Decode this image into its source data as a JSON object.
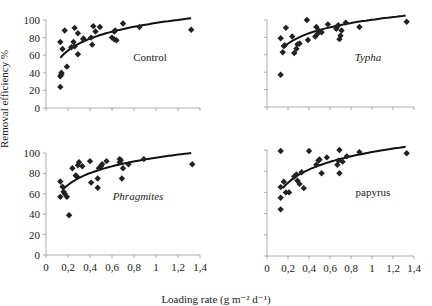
{
  "figure": {
    "ylabel": "Removal efficiency %",
    "xlabel": "Loading rate (g m⁻² d⁻¹)",
    "marker_color": "#222222",
    "line_color": "#111111",
    "axis_color": "#999999"
  },
  "chart_data": [
    {
      "type": "scatter",
      "title": "Control",
      "title_style": "normal",
      "xlabel": "",
      "ylabel": "Removal efficiency %",
      "xlim": [
        0,
        1.4
      ],
      "ylim": [
        0,
        100
      ],
      "xticks": [
        "0",
        "0,2",
        "0,4",
        "0,6",
        "0,8",
        "1",
        "1,2",
        "1,4"
      ],
      "yticks": [
        "0",
        "20",
        "40",
        "60",
        "80",
        "100"
      ],
      "show_x_tick_labels": false,
      "show_y_tick_labels": true,
      "points": [
        [
          0.13,
          24
        ],
        [
          0.13,
          36
        ],
        [
          0.14,
          38
        ],
        [
          0.14,
          40
        ],
        [
          0.13,
          75
        ],
        [
          0.15,
          67
        ],
        [
          0.17,
          88
        ],
        [
          0.19,
          47
        ],
        [
          0.23,
          69
        ],
        [
          0.25,
          75
        ],
        [
          0.26,
          91
        ],
        [
          0.26,
          70
        ],
        [
          0.29,
          85
        ],
        [
          0.29,
          61
        ],
        [
          0.34,
          78
        ],
        [
          0.34,
          79
        ],
        [
          0.41,
          80
        ],
        [
          0.42,
          72
        ],
        [
          0.43,
          93
        ],
        [
          0.45,
          87
        ],
        [
          0.49,
          92
        ],
        [
          0.6,
          80
        ],
        [
          0.62,
          78
        ],
        [
          0.62,
          87
        ],
        [
          0.63,
          88
        ],
        [
          0.64,
          77
        ],
        [
          0.7,
          96
        ],
        [
          0.85,
          92
        ],
        [
          1.32,
          89
        ]
      ],
      "trend": {
        "type": "log",
        "x_from": 0.13,
        "x_to": 1.32,
        "y_from": 57,
        "y_to": 102
      }
    },
    {
      "type": "scatter",
      "title": "Typha",
      "title_style": "italic",
      "xlim": [
        0,
        1.4
      ],
      "ylim": [
        0,
        100
      ],
      "xticks": [
        "0",
        "0,2",
        "0,4",
        "0,6",
        "0,8",
        "1",
        "1,2",
        "1,4"
      ],
      "yticks": [
        "0",
        "20",
        "40",
        "60",
        "80",
        "100"
      ],
      "show_x_tick_labels": false,
      "show_y_tick_labels": false,
      "points": [
        [
          0.13,
          37
        ],
        [
          0.13,
          79
        ],
        [
          0.15,
          63
        ],
        [
          0.16,
          70
        ],
        [
          0.17,
          71
        ],
        [
          0.18,
          91
        ],
        [
          0.24,
          81
        ],
        [
          0.26,
          62
        ],
        [
          0.28,
          67
        ],
        [
          0.29,
          72
        ],
        [
          0.31,
          73
        ],
        [
          0.38,
          100
        ],
        [
          0.39,
          77
        ],
        [
          0.46,
          81
        ],
        [
          0.47,
          92
        ],
        [
          0.48,
          84
        ],
        [
          0.49,
          88
        ],
        [
          0.52,
          86
        ],
        [
          0.58,
          95
        ],
        [
          0.66,
          90
        ],
        [
          0.67,
          93
        ],
        [
          0.68,
          94
        ],
        [
          0.69,
          78
        ],
        [
          0.7,
          82
        ],
        [
          0.71,
          88
        ],
        [
          0.75,
          97
        ],
        [
          0.88,
          92
        ],
        [
          1.33,
          98
        ]
      ],
      "trend": {
        "type": "log",
        "x_from": 0.15,
        "x_to": 1.32,
        "y_from": 68,
        "y_to": 105
      }
    },
    {
      "type": "scatter",
      "title": "Phragmites",
      "title_style": "italic",
      "xlim": [
        0,
        1.4
      ],
      "ylim": [
        0,
        100
      ],
      "xticks": [
        "0",
        "0,2",
        "0,4",
        "0,6",
        "0,8",
        "1",
        "1,2",
        "1,4"
      ],
      "yticks": [
        "0",
        "20",
        "40",
        "60",
        "80",
        "100"
      ],
      "show_x_tick_labels": true,
      "show_y_tick_labels": true,
      "points": [
        [
          0.13,
          57
        ],
        [
          0.13,
          72
        ],
        [
          0.15,
          67
        ],
        [
          0.16,
          62
        ],
        [
          0.17,
          60
        ],
        [
          0.19,
          57
        ],
        [
          0.21,
          39
        ],
        [
          0.24,
          85
        ],
        [
          0.27,
          78
        ],
        [
          0.28,
          77
        ],
        [
          0.29,
          88
        ],
        [
          0.3,
          91
        ],
        [
          0.33,
          87
        ],
        [
          0.4,
          92
        ],
        [
          0.41,
          71
        ],
        [
          0.47,
          66
        ],
        [
          0.47,
          75
        ],
        [
          0.48,
          85
        ],
        [
          0.5,
          87
        ],
        [
          0.51,
          89
        ],
        [
          0.55,
          92
        ],
        [
          0.67,
          91
        ],
        [
          0.67,
          94
        ],
        [
          0.68,
          93
        ],
        [
          0.69,
          75
        ],
        [
          0.7,
          85
        ],
        [
          0.75,
          89
        ],
        [
          0.89,
          94
        ],
        [
          1.33,
          89
        ]
      ],
      "trend": {
        "type": "log",
        "x_from": 0.15,
        "x_to": 1.32,
        "y_from": 64,
        "y_to": 100
      }
    },
    {
      "type": "scatter",
      "title": "papyrus",
      "title_style": "normal",
      "xlim": [
        0,
        1.4
      ],
      "ylim": [
        0,
        100
      ],
      "xticks": [
        "0",
        "0,2",
        "0,4",
        "0,6",
        "0,8",
        "1",
        "1,2",
        "1,4"
      ],
      "yticks": [
        "0",
        "20",
        "40",
        "60",
        "80",
        "100"
      ],
      "show_x_tick_labels": true,
      "show_y_tick_labels": false,
      "points": [
        [
          0.13,
          44
        ],
        [
          0.13,
          55
        ],
        [
          0.13,
          65
        ],
        [
          0.13,
          99
        ],
        [
          0.16,
          70
        ],
        [
          0.18,
          60
        ],
        [
          0.21,
          60
        ],
        [
          0.26,
          75
        ],
        [
          0.28,
          77
        ],
        [
          0.29,
          71
        ],
        [
          0.31,
          68
        ],
        [
          0.33,
          79
        ],
        [
          0.35,
          64
        ],
        [
          0.4,
          99
        ],
        [
          0.47,
          86
        ],
        [
          0.49,
          90
        ],
        [
          0.5,
          91
        ],
        [
          0.52,
          78
        ],
        [
          0.57,
          93
        ],
        [
          0.67,
          86
        ],
        [
          0.68,
          90
        ],
        [
          0.69,
          100
        ],
        [
          0.69,
          78
        ],
        [
          0.72,
          89
        ],
        [
          0.76,
          94
        ],
        [
          0.88,
          98
        ],
        [
          1.33,
          97
        ]
      ],
      "trend": {
        "type": "log",
        "x_from": 0.15,
        "x_to": 1.32,
        "y_from": 64,
        "y_to": 103
      }
    }
  ],
  "layout": {
    "panels": [
      {
        "x0": 46,
        "x1": 200,
        "y0": 108,
        "y1": 20,
        "label_x": 150,
        "label_y": 61
      },
      {
        "x0": 267,
        "x1": 414,
        "y0": 107,
        "y1": 20,
        "label_x": 368,
        "label_y": 61
      },
      {
        "x0": 46,
        "x1": 200,
        "y0": 255,
        "y1": 153,
        "label_x": 138,
        "label_y": 200
      },
      {
        "x0": 267,
        "x1": 414,
        "y0": 256,
        "y1": 150,
        "label_x": 373,
        "label_y": 196
      }
    ]
  }
}
